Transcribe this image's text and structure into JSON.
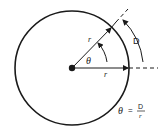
{
  "diagram": {
    "labels": {
      "radius_diagonal": "r",
      "radius_horizontal": "r",
      "angle": "θ",
      "arc_length": "D"
    },
    "formula": {
      "lhs": "θ",
      "equals": "=",
      "numerator": "D",
      "denominator": "r"
    },
    "colors": {
      "stroke": "#1a1a1a",
      "background": "#ffffff"
    }
  }
}
